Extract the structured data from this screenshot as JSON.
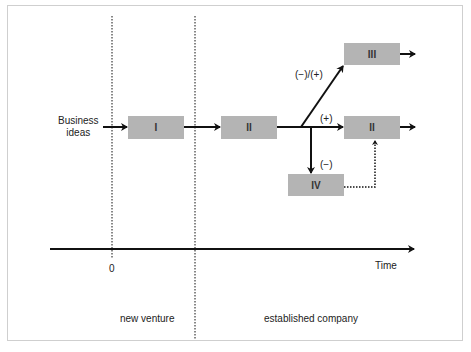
{
  "diagram": {
    "input_label_line1": "Business",
    "input_label_line2": "ideas",
    "boxes": {
      "box1": "I",
      "box2_left": "II",
      "box3": "III",
      "box2_right": "II",
      "box4": "IV"
    },
    "branch_labels": {
      "up": "(−)/(+)",
      "straight": "(+)",
      "down": "(−)"
    },
    "axis": {
      "origin_label": "0",
      "time_label": "Time"
    },
    "phases": {
      "new_venture": "new venture",
      "established_company": "established company"
    },
    "colors": {
      "box_fill": "#b4b4b4",
      "line": "#111111",
      "frame": "#cfcfcf"
    }
  }
}
